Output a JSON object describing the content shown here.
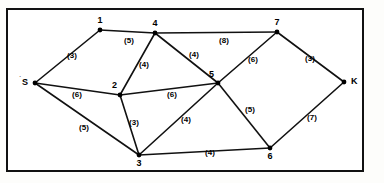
{
  "figure": {
    "type": "network-graph"
  },
  "chart_data": {
    "type": "diagram",
    "title": "",
    "nodes": [
      {
        "id": "S",
        "label": "S",
        "x": 35,
        "y": 83,
        "role": "source"
      },
      {
        "id": "1",
        "label": "1",
        "x": 100,
        "y": 30,
        "role": "intermediate"
      },
      {
        "id": "4",
        "label": "4",
        "x": 155,
        "y": 33,
        "role": "intermediate"
      },
      {
        "id": "7",
        "label": "7",
        "x": 277,
        "y": 32,
        "role": "intermediate"
      },
      {
        "id": "2",
        "label": "2",
        "x": 120,
        "y": 95,
        "role": "intermediate"
      },
      {
        "id": "5",
        "label": "5",
        "x": 218,
        "y": 83,
        "role": "intermediate"
      },
      {
        "id": "3",
        "label": "3",
        "x": 139,
        "y": 155,
        "role": "intermediate"
      },
      {
        "id": "6",
        "label": "6",
        "x": 270,
        "y": 148,
        "role": "intermediate"
      },
      {
        "id": "K",
        "label": "K",
        "x": 344,
        "y": 82,
        "role": "sink"
      }
    ],
    "edges": [
      {
        "from": "S",
        "to": "1",
        "weight": 3,
        "label": "(3)",
        "lx": 72,
        "ly": 58
      },
      {
        "from": "S",
        "to": "2",
        "weight": 6,
        "label": "(6)",
        "lx": 77,
        "ly": 97
      },
      {
        "from": "S",
        "to": "3",
        "weight": 5,
        "label": "(5)",
        "lx": 84,
        "ly": 130
      },
      {
        "from": "1",
        "to": "4",
        "weight": 5,
        "label": "(5)",
        "lx": 129,
        "ly": 43
      },
      {
        "from": "4",
        "to": "7",
        "weight": 8,
        "label": "(8)",
        "lx": 224,
        "ly": 43
      },
      {
        "from": "4",
        "to": "2",
        "weight": 4,
        "label": "(4)",
        "lx": 144,
        "ly": 67
      },
      {
        "from": "4",
        "to": "5",
        "weight": 4,
        "label": "(4)",
        "lx": 194,
        "ly": 57
      },
      {
        "from": "2",
        "to": "5",
        "weight": 6,
        "label": "(6)",
        "lx": 172,
        "ly": 97
      },
      {
        "from": "2",
        "to": "3",
        "weight": 3,
        "label": "(3)",
        "lx": 134,
        "ly": 125
      },
      {
        "from": "3",
        "to": "5",
        "weight": 4,
        "label": "(4)",
        "lx": 186,
        "ly": 122
      },
      {
        "from": "3",
        "to": "6",
        "weight": 4,
        "label": "(4)",
        "lx": 210,
        "ly": 155
      },
      {
        "from": "5",
        "to": "7",
        "weight": 6,
        "label": "(6)",
        "lx": 253,
        "ly": 62
      },
      {
        "from": "5",
        "to": "6",
        "weight": 5,
        "label": "(5)",
        "lx": 250,
        "ly": 112
      },
      {
        "from": "7",
        "to": "K",
        "weight": 3,
        "label": "(3)",
        "lx": 310,
        "ly": 61
      },
      {
        "from": "6",
        "to": "K",
        "weight": 7,
        "label": "(7)",
        "lx": 312,
        "ly": 120
      }
    ],
    "legend": [],
    "xlabel": "",
    "ylabel": "",
    "grid": false
  },
  "annotations": {
    "source_tick": "`"
  }
}
